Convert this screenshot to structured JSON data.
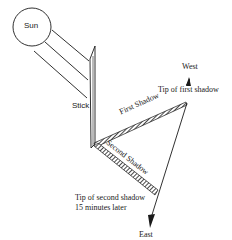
{
  "figure": {
    "type": "diagram",
    "labels": {
      "sun": "Sun",
      "stick": "Stick",
      "first_shadow": "First Shadow",
      "second_shadow": "Second Shadow",
      "tip_first": "Tip of first shadow",
      "tip_second_line1": "Tip of second shadow",
      "tip_second_line2": "15 minutes later",
      "west": "West",
      "east": "East"
    },
    "colors": {
      "ink": "#1a1a1a",
      "background": "#ffffff"
    }
  }
}
